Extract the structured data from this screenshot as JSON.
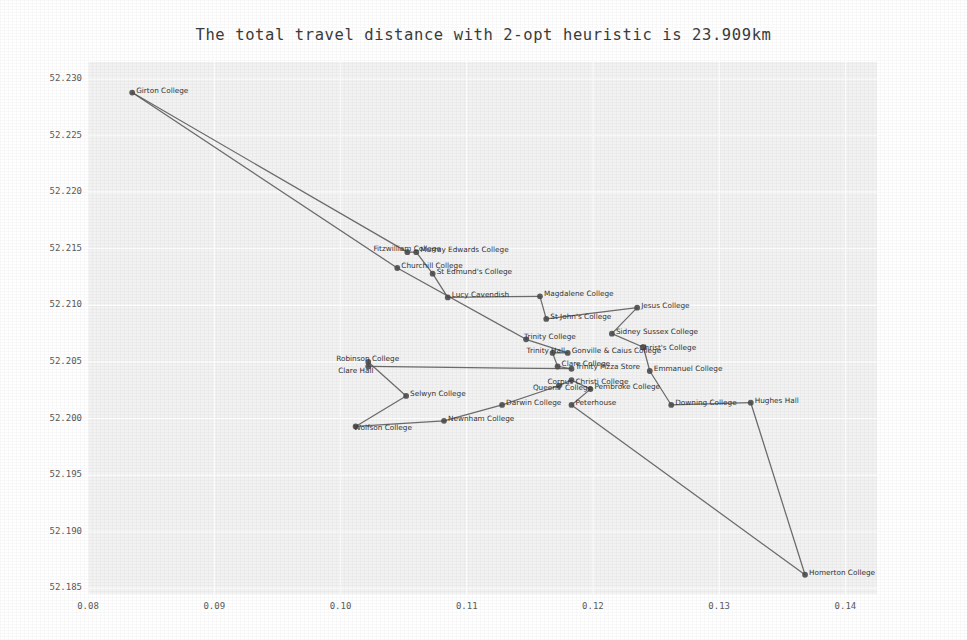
{
  "figure": {
    "title": "The total travel distance with 2-opt heuristic is 23.909km",
    "width": 967,
    "height": 640,
    "background_color": "#ffffff",
    "plot_background_color": "#f2f2f2",
    "grid_color": "#ffffff",
    "line_color": "#555555",
    "marker_color": "#4d4d4d",
    "text_color": "#333333"
  },
  "chart_data": {
    "type": "scatter",
    "title": "The total travel distance with 2-opt heuristic is 23.909km",
    "xlabel": "",
    "ylabel": "",
    "xlim": [
      0.08,
      0.1425
    ],
    "ylim": [
      52.1845,
      52.2315
    ],
    "grid": true,
    "legend": "none",
    "xticks": [
      "0.08",
      "0.09",
      "0.10",
      "0.11",
      "0.12",
      "0.13",
      "0.14"
    ],
    "xtick_values": [
      0.08,
      0.09,
      0.1,
      0.11,
      0.12,
      0.13,
      0.14
    ],
    "yticks": [
      "52.185",
      "52.190",
      "52.195",
      "52.200",
      "52.205",
      "52.210",
      "52.215",
      "52.220",
      "52.225",
      "52.230"
    ],
    "ytick_values": [
      52.185,
      52.19,
      52.195,
      52.2,
      52.205,
      52.21,
      52.215,
      52.22,
      52.225,
      52.23
    ],
    "annotation": "Travelling salesman tour over Cambridge colleges improved by the 2-opt heuristic",
    "total_distance_km": 23.909,
    "heuristic": "2-opt",
    "points": [
      {
        "label": "Girton College",
        "x": 0.0835,
        "y": 52.2288
      },
      {
        "label": "Churchill College",
        "x": 0.1045,
        "y": 52.2133
      },
      {
        "label": "Fitzwilliam College",
        "x": 0.1053,
        "y": 52.2147
      },
      {
        "label": "Murray Edwards College",
        "x": 0.106,
        "y": 52.2147
      },
      {
        "label": "St Edmund's College",
        "x": 0.1073,
        "y": 52.2128
      },
      {
        "label": "Lucy Cavendish",
        "x": 0.1085,
        "y": 52.2107
      },
      {
        "label": "Magdalene College",
        "x": 0.1158,
        "y": 52.2108
      },
      {
        "label": "St John's College",
        "x": 0.1163,
        "y": 52.2088
      },
      {
        "label": "Jesus College",
        "x": 0.1235,
        "y": 52.2098
      },
      {
        "label": "Sidney Sussex College",
        "x": 0.1215,
        "y": 52.2075
      },
      {
        "label": "Christ's College",
        "x": 0.124,
        "y": 52.2063
      },
      {
        "label": "Trinity College",
        "x": 0.1147,
        "y": 52.207
      },
      {
        "label": "Trinity Hall",
        "x": 0.1168,
        "y": 52.2058
      },
      {
        "label": "Gonville & Caius College",
        "x": 0.118,
        "y": 52.2058
      },
      {
        "label": "Robinson College",
        "x": 0.1022,
        "y": 52.205
      },
      {
        "label": "Clare Hall",
        "x": 0.1022,
        "y": 52.2046
      },
      {
        "label": "Clare College",
        "x": 0.1172,
        "y": 52.2046
      },
      {
        "label": "Trinity Pizza Store",
        "x": 0.1183,
        "y": 52.2044
      },
      {
        "label": "Emmanuel College",
        "x": 0.1245,
        "y": 52.2042
      },
      {
        "label": "Corpus Christi College",
        "x": 0.1183,
        "y": 52.2034
      },
      {
        "label": "Queens' College",
        "x": 0.1173,
        "y": 52.2029
      },
      {
        "label": "Pembroke College",
        "x": 0.1198,
        "y": 52.2026
      },
      {
        "label": "Selwyn College",
        "x": 0.1052,
        "y": 52.202
      },
      {
        "label": "Darwin College",
        "x": 0.1128,
        "y": 52.2012
      },
      {
        "label": "Peterhouse",
        "x": 0.1183,
        "y": 52.2012
      },
      {
        "label": "Downing College",
        "x": 0.1262,
        "y": 52.2012
      },
      {
        "label": "Hughes Hall",
        "x": 0.1325,
        "y": 52.2014
      },
      {
        "label": "Newnham College",
        "x": 0.1082,
        "y": 52.1998
      },
      {
        "label": "Wolfson College",
        "x": 0.1012,
        "y": 52.1993
      },
      {
        "label": "Homerton College",
        "x": 0.1368,
        "y": 52.1862
      }
    ],
    "tour": [
      "Girton College",
      "Fitzwilliam College",
      "Murray Edwards College",
      "St Edmund's College",
      "Lucy Cavendish",
      "Magdalene College",
      "St John's College",
      "Jesus College",
      "Sidney Sussex College",
      "Christ's College",
      "Emmanuel College",
      "Downing College",
      "Hughes Hall",
      "Homerton College",
      "Peterhouse",
      "Pembroke College",
      "Corpus Christi College",
      "Queens' College",
      "Darwin College",
      "Newnham College",
      "Wolfson College",
      "Selwyn College",
      "Robinson College",
      "Clare Hall",
      "Trinity Pizza Store",
      "Clare College",
      "Trinity Hall",
      "Gonville & Caius College",
      "Trinity College",
      "Churchill College",
      "Girton College"
    ],
    "label_offsets": {
      "Fitzwilliam College": [
        -34,
        -4
      ],
      "Clare Hall": [
        -30,
        4
      ],
      "Robinson College": [
        -32,
        -4
      ],
      "Wolfson College": [
        -2,
        1
      ],
      "Trinity Hall": [
        -26,
        -3
      ],
      "Corpus Christi College": [
        -24,
        1
      ],
      "Queens' College": [
        -26,
        1
      ],
      "Trinity College": [
        -2,
        -3
      ],
      "Christ's College": [
        -4,
        0
      ]
    }
  }
}
